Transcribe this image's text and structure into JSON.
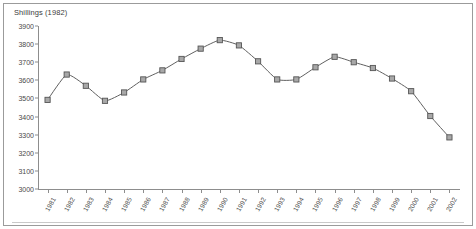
{
  "chart_data": {
    "type": "line",
    "title": "Shillings (1982)",
    "xlabel": "",
    "ylabel": "",
    "ylim": [
      3000,
      3900
    ],
    "ytick_step": 100,
    "yticks": [
      3900,
      3800,
      3700,
      3600,
      3500,
      3400,
      3300,
      3200,
      3100,
      3000
    ],
    "grid": false,
    "legend": "none",
    "marker": "square",
    "line_color": "#606060",
    "marker_fill": "#a8a8a8",
    "marker_edge": "#555555",
    "categories": [
      "1981",
      "1982",
      "1983",
      "1984",
      "1985",
      "1986",
      "1987",
      "1988",
      "1989",
      "1990",
      "1991",
      "1992",
      "1993",
      "1994",
      "1995",
      "1996",
      "1997",
      "1998",
      "1999",
      "2000",
      "2001",
      "2002"
    ],
    "values": [
      3492,
      3632,
      3570,
      3487,
      3533,
      3605,
      3655,
      3718,
      3775,
      3822,
      3793,
      3705,
      3605,
      3605,
      3672,
      3730,
      3700,
      3668,
      3610,
      3540,
      3403,
      3285
    ],
    "series": [
      {
        "name": "Shillings (1982)",
        "values": [
          3492,
          3632,
          3570,
          3487,
          3533,
          3605,
          3655,
          3718,
          3775,
          3822,
          3793,
          3705,
          3605,
          3605,
          3672,
          3730,
          3700,
          3668,
          3610,
          3540,
          3403,
          3285
        ]
      }
    ]
  }
}
